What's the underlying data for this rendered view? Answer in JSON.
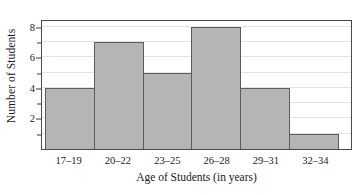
{
  "chart_data": {
    "type": "bar",
    "title": "",
    "subtitle": "",
    "xlabel": "Age of Students (in years)",
    "ylabel": "Number of Students",
    "categories": [
      "17–19",
      "20–22",
      "23–25",
      "26–28",
      "29–31",
      "32–34"
    ],
    "values": [
      4,
      7,
      5,
      8,
      4,
      1
    ],
    "series": [
      {
        "name": "Number of Students",
        "values": [
          4,
          7,
          5,
          8,
          4,
          1
        ]
      }
    ],
    "ylim": [
      0,
      8.5
    ],
    "y_ticks": [
      1,
      2,
      3,
      4,
      5,
      6,
      7,
      8
    ],
    "y_tick_labels": [
      "",
      "2",
      "",
      "4",
      "",
      "6",
      "",
      "8"
    ],
    "gridlines": {
      "horizontal": true,
      "vertical": false,
      "values": [
        1,
        2,
        3,
        4,
        5,
        6,
        7,
        8
      ]
    },
    "legend": {
      "visible": false,
      "position": "none",
      "entries": []
    },
    "annotations": [],
    "style": {
      "bar_fill": "#b5b5b5",
      "bar_border": "#5c5c5c",
      "gridline_color": "#e3e3e3",
      "frame_color": "#4a4a4a",
      "background": "#ffffff",
      "text_color": "#1a1a1a"
    }
  }
}
